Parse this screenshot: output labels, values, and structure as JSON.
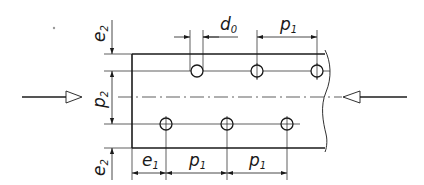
{
  "diagram": {
    "type": "bolted-plate-spacing",
    "labels": {
      "e2_top": {
        "base": "e",
        "sub": "2"
      },
      "p2": {
        "base": "p",
        "sub": "2"
      },
      "e2_bottom": {
        "base": "e",
        "sub": "2"
      },
      "d0": {
        "base": "d",
        "sub": "0"
      },
      "p1_top": {
        "base": "p",
        "sub": "1"
      },
      "e1": {
        "base": "e",
        "sub": "1"
      },
      "p1_bottom_a": {
        "base": "p",
        "sub": "1"
      },
      "p1_bottom_b": {
        "base": "p",
        "sub": "1"
      }
    },
    "holes": {
      "top_row": 3,
      "bottom_row": 3
    },
    "force_arrows": {
      "left": "load-arrow-right",
      "right": "load-arrow-left"
    },
    "colors": {
      "line": "#1a1a1a",
      "background": "#ffffff"
    }
  }
}
